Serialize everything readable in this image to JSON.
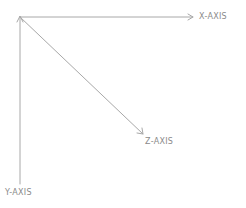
{
  "diagram": {
    "type": "3d-axes",
    "line_color": "#a8a8a8",
    "label_color": "#8a8a8a",
    "origin": {
      "x": 20,
      "y": 17
    },
    "axes": {
      "x": {
        "label": "X-AXIS",
        "end": {
          "x": 193,
          "y": 17
        }
      },
      "y": {
        "label": "Y-AXIS",
        "end": {
          "x": 20,
          "y": 184
        }
      },
      "z": {
        "label": "Z-AXIS",
        "end": {
          "x": 143,
          "y": 134
        }
      }
    }
  }
}
